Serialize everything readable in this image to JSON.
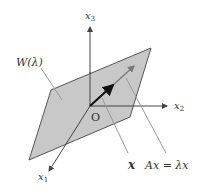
{
  "diagram": {
    "subspace_label": "W(λ)",
    "origin_label": "O",
    "axes": {
      "x1": {
        "base": "x",
        "sub": "1"
      },
      "x2": {
        "base": "x",
        "sub": "2"
      },
      "x3": {
        "base": "x",
        "sub": "3"
      }
    },
    "vector_label": "x",
    "image_label": "Ax = λx",
    "colors": {
      "plane_fill": "#c8c8c8",
      "plane_stroke": "#555555",
      "axis": "#444444",
      "vector": "#111111",
      "image_vector": "#666666",
      "leader": "#999999"
    }
  }
}
